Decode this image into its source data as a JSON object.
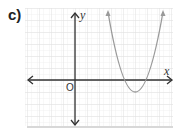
{
  "problem_label": "c)",
  "axes": {
    "x_label": "x",
    "y_label": "y",
    "origin_label": "O"
  },
  "colors": {
    "grid_minor": "#eeeeee",
    "grid_major": "#e2e2e2",
    "axis": "#333333",
    "curve": "#9a9a9a",
    "frame_shadow": "#d8d8d8"
  },
  "graph": {
    "curve_type": "upward-opening parabola",
    "vertex_position": "below x-axis, right of y-axis",
    "x_intercepts": "two positive roots"
  }
}
